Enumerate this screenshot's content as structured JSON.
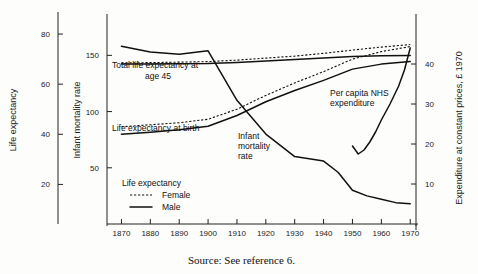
{
  "figure": {
    "source_note": "Source: See reference 6."
  },
  "chart_data": {
    "type": "line",
    "title": "",
    "xlabel": "",
    "x": [
      1870,
      1880,
      1890,
      1900,
      1910,
      1920,
      1930,
      1940,
      1950,
      1960,
      1970
    ],
    "xticklabels": [
      "1870",
      "1880",
      "1890",
      "1900",
      "1910",
      "1920",
      "1930",
      "1940",
      "1950",
      "1960",
      "1970"
    ],
    "xlim": [
      1865,
      1972
    ],
    "grid": false,
    "legend_position": "lower-left-inside",
    "axes": [
      {
        "id": "life-expectancy",
        "position": "far-left",
        "label": "Life expectancy",
        "ticks": [
          20,
          40,
          60,
          80
        ],
        "ticklabels": [
          "20",
          "40",
          "60",
          "80"
        ],
        "lim": [
          5,
          88
        ]
      },
      {
        "id": "infant-mortality",
        "position": "left",
        "label": "Infant mortality rate",
        "ticks": [
          50,
          100,
          150
        ],
        "ticklabels": [
          "50",
          "100",
          "150"
        ],
        "lim": [
          0,
          185
        ]
      },
      {
        "id": "nhs-expenditure",
        "position": "right",
        "label": "Expenditure at constant prices,  £ 1970",
        "ticks": [
          10,
          20,
          30,
          40
        ],
        "ticklabels": [
          "10",
          "20",
          "30",
          "40"
        ],
        "lim": [
          0,
          52
        ]
      }
    ],
    "legend": {
      "title": "Life expectancy",
      "entries": [
        {
          "label": "Female",
          "style": "dotted"
        },
        {
          "label": "Male",
          "style": "solid"
        }
      ]
    },
    "annotations": [
      {
        "name": "total-life-expectancy-at-age-45",
        "lines": [
          "Total  life expectancy at",
          "age 45"
        ]
      },
      {
        "name": "life-expectancy-at-birth",
        "lines": [
          "Life  expectancy at birth"
        ]
      },
      {
        "name": "infant-mortality-rate",
        "lines": [
          "Infant",
          "mortality",
          "rate"
        ]
      },
      {
        "name": "per-capita-nhs-expenditure",
        "lines": [
          "Per capita NHS",
          "expenditure"
        ]
      }
    ],
    "series": [
      {
        "name": "Infant mortality rate",
        "axis": "infant-mortality",
        "style": "solid",
        "x": [
          1870,
          1880,
          1890,
          1900,
          1910,
          1920,
          1930,
          1940,
          1945,
          1950,
          1955,
          1960,
          1965,
          1970
        ],
        "values": [
          158,
          153,
          151,
          154,
          110,
          80,
          60,
          56,
          46,
          30,
          25,
          22,
          19,
          18
        ]
      },
      {
        "name": "Total life expectancy at age 45 — Female",
        "axis": "life-expectancy",
        "style": "dotted",
        "x": [
          1870,
          1880,
          1890,
          1900,
          1910,
          1920,
          1930,
          1940,
          1950,
          1960,
          1970
        ],
        "values": [
          68.5,
          68.6,
          68.8,
          69.0,
          69.6,
          70.4,
          71.2,
          72.3,
          73.6,
          74.8,
          75.8
        ]
      },
      {
        "name": "Total life expectancy at age 45 — Male",
        "axis": "life-expectancy",
        "style": "solid",
        "x": [
          1870,
          1880,
          1890,
          1900,
          1910,
          1920,
          1930,
          1940,
          1950,
          1960,
          1970
        ],
        "values": [
          68.0,
          68.0,
          68.1,
          68.2,
          68.6,
          69.2,
          69.8,
          70.4,
          71.0,
          71.3,
          71.4
        ]
      },
      {
        "name": "Life expectancy at birth — Female",
        "axis": "life-expectancy",
        "style": "dotted",
        "x": [
          1870,
          1880,
          1890,
          1900,
          1910,
          1920,
          1930,
          1940,
          1950,
          1960,
          1970
        ],
        "values": [
          43.0,
          43.8,
          44.6,
          46.0,
          50.0,
          55.5,
          60.5,
          65.0,
          70.0,
          73.0,
          75.0
        ]
      },
      {
        "name": "Life expectancy at birth — Male",
        "axis": "life-expectancy",
        "style": "solid",
        "x": [
          1870,
          1880,
          1890,
          1900,
          1910,
          1920,
          1930,
          1940,
          1950,
          1960,
          1970
        ],
        "values": [
          40.0,
          40.8,
          41.8,
          43.2,
          47.5,
          53.0,
          57.5,
          61.5,
          66.0,
          68.0,
          69.0
        ]
      },
      {
        "name": "Per capita NHS expenditure",
        "axis": "nhs-expenditure",
        "style": "solid",
        "x": [
          1950,
          1952,
          1954,
          1956,
          1958,
          1960,
          1963,
          1966,
          1968,
          1970
        ],
        "values": [
          19.5,
          17.5,
          18.5,
          20.5,
          23.0,
          26.0,
          30.0,
          34.5,
          38.5,
          44.0
        ]
      }
    ]
  }
}
